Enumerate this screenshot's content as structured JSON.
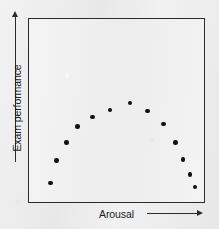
{
  "chart_data": {
    "type": "scatter",
    "title": "",
    "xlabel": "Arousal",
    "ylabel": "Exam performance",
    "x_axis_shows_ticks": false,
    "y_axis_shows_ticks": false,
    "grid": false,
    "legend": null,
    "annotations": [],
    "xlim": [
      0,
      100
    ],
    "ylim": [
      0,
      100
    ],
    "point_color": "#111111",
    "frame_color": "#2b2b2b",
    "background_color": "#ebebeb",
    "plot_background_color": "#efefef",
    "points": [
      {
        "x": 12.4,
        "y": 10.3
      },
      {
        "x": 15.8,
        "y": 22.7
      },
      {
        "x": 21.5,
        "y": 32.4
      },
      {
        "x": 27.7,
        "y": 41.1
      },
      {
        "x": 36.2,
        "y": 46.5
      },
      {
        "x": 46.3,
        "y": 50.3
      },
      {
        "x": 57.6,
        "y": 54.1
      },
      {
        "x": 67.8,
        "y": 49.7
      },
      {
        "x": 76.8,
        "y": 42.7
      },
      {
        "x": 83.6,
        "y": 32.4
      },
      {
        "x": 88.1,
        "y": 23.2
      },
      {
        "x": 92.1,
        "y": 15.1
      },
      {
        "x": 94.9,
        "y": 8.1
      }
    ]
  },
  "axes": {
    "y_label": "Exam performance",
    "x_label": "Arousal",
    "y_arrow_direction": "up",
    "x_arrow_direction": "right"
  }
}
